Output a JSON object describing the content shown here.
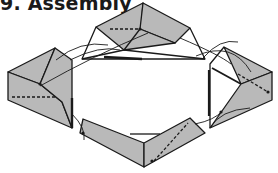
{
  "title": "9. Assembly",
  "colors": {
    "fill": "#b9b9b9",
    "stroke": "#1a1a1a",
    "background": "#ffffff"
  },
  "diagram": {
    "type": "origami assembly step",
    "units": [
      "top-unit",
      "left-unit",
      "right-unit",
      "bottom-unit"
    ],
    "connectors": "curved arrows indicating tab insertion into pockets"
  }
}
